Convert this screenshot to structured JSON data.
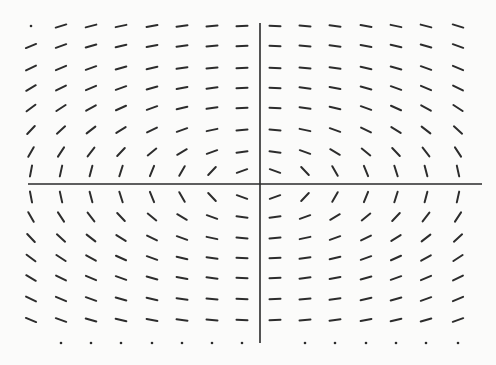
{
  "diagram": {
    "type": "slope_field",
    "colors": {
      "ink": "#2c2c2c",
      "background": "#fbfbfa",
      "axis": "#2a2a2a"
    },
    "axes": {
      "horizontal": {
        "x1": 28,
        "x2": 482,
        "y": 184
      },
      "vertical": {
        "x": 260,
        "y1": 23,
        "y2": 343
      }
    },
    "grid": {
      "columns_x": [
        31,
        61,
        91,
        121,
        152,
        182,
        212,
        242,
        275,
        305,
        335,
        366,
        396,
        426,
        458
      ],
      "rows_y": [
        26,
        46,
        68,
        88,
        108,
        130,
        152,
        171,
        197,
        217,
        238,
        258,
        278,
        299,
        320,
        343
      ],
      "column_units": [
        -7.5,
        -6.5,
        -5.5,
        -4.5,
        -3.5,
        -2.5,
        -1.5,
        -0.5,
        0.5,
        1.5,
        2.5,
        3.5,
        4.5,
        5.5,
        6.5
      ],
      "row_units": [
        7.5,
        6.5,
        5.5,
        4.5,
        3.5,
        2.5,
        1.5,
        0.5,
        -0.5,
        -1.5,
        -2.5,
        -3.5,
        -4.5,
        -5.5,
        -6.5,
        -7.5
      ],
      "aspect": 0.35,
      "segment_length": 11,
      "dots": [
        [
          0,
          0
        ],
        [
          15,
          1
        ],
        [
          15,
          2
        ],
        [
          15,
          3
        ],
        [
          15,
          4
        ],
        [
          15,
          5
        ],
        [
          15,
          6
        ],
        [
          15,
          8
        ],
        [
          15,
          9
        ],
        [
          15,
          10
        ],
        [
          15,
          11
        ],
        [
          15,
          12
        ],
        [
          15,
          13
        ],
        [
          15,
          14
        ]
      ]
    }
  }
}
